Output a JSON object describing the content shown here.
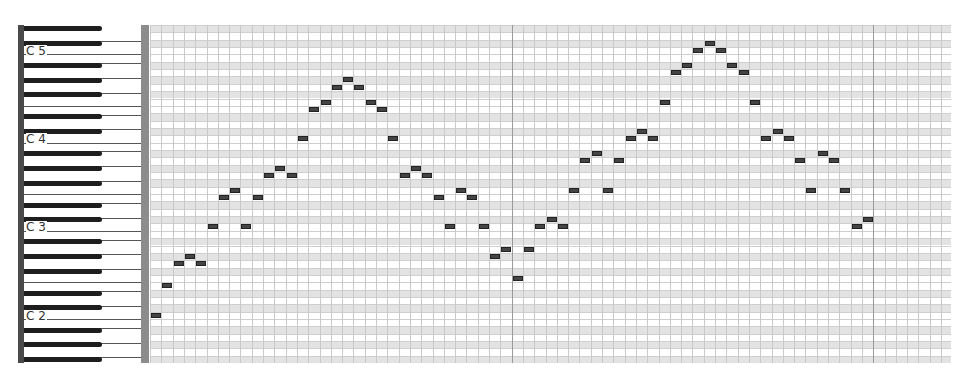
{
  "window": {
    "title": "Piano Roll"
  },
  "keyboard": {
    "octave_labels": [
      {
        "label": "C 5",
        "row": 3
      },
      {
        "label": "C 4",
        "row": 15
      },
      {
        "label": "C 3",
        "row": 27
      },
      {
        "label": "C 2",
        "row": 39
      }
    ],
    "top_pitch": 75,
    "row_count": 46
  },
  "grid": {
    "columns": 71,
    "column_width": 11.3,
    "row_height": 7.35,
    "bar_every": 32,
    "colors": {
      "black_row": "#e3e3e3",
      "line": "#cfcfcf",
      "bar_line": "#9a9a9a",
      "note": "#444444"
    }
  },
  "notes": [
    {
      "col": 0,
      "row": 39
    },
    {
      "col": 1,
      "row": 35
    },
    {
      "col": 2,
      "row": 32
    },
    {
      "col": 3,
      "row": 31
    },
    {
      "col": 4,
      "row": 32
    },
    {
      "col": 5,
      "row": 27
    },
    {
      "col": 6,
      "row": 23
    },
    {
      "col": 7,
      "row": 22
    },
    {
      "col": 8,
      "row": 27
    },
    {
      "col": 9,
      "row": 23
    },
    {
      "col": 10,
      "row": 20
    },
    {
      "col": 11,
      "row": 19
    },
    {
      "col": 12,
      "row": 20
    },
    {
      "col": 13,
      "row": 15
    },
    {
      "col": 14,
      "row": 11
    },
    {
      "col": 15,
      "row": 10
    },
    {
      "col": 16,
      "row": 8
    },
    {
      "col": 17,
      "row": 7
    },
    {
      "col": 18,
      "row": 8
    },
    {
      "col": 19,
      "row": 10
    },
    {
      "col": 20,
      "row": 11
    },
    {
      "col": 21,
      "row": 15
    },
    {
      "col": 22,
      "row": 20
    },
    {
      "col": 23,
      "row": 19
    },
    {
      "col": 24,
      "row": 20
    },
    {
      "col": 25,
      "row": 23
    },
    {
      "col": 26,
      "row": 27
    },
    {
      "col": 27,
      "row": 22
    },
    {
      "col": 28,
      "row": 23
    },
    {
      "col": 29,
      "row": 27
    },
    {
      "col": 30,
      "row": 31
    },
    {
      "col": 31,
      "row": 30
    },
    {
      "col": 32,
      "row": 34
    },
    {
      "col": 33,
      "row": 30
    },
    {
      "col": 34,
      "row": 27
    },
    {
      "col": 35,
      "row": 26
    },
    {
      "col": 36,
      "row": 27
    },
    {
      "col": 37,
      "row": 22
    },
    {
      "col": 38,
      "row": 18
    },
    {
      "col": 39,
      "row": 17
    },
    {
      "col": 40,
      "row": 22
    },
    {
      "col": 41,
      "row": 18
    },
    {
      "col": 42,
      "row": 15
    },
    {
      "col": 43,
      "row": 14
    },
    {
      "col": 44,
      "row": 15
    },
    {
      "col": 45,
      "row": 10
    },
    {
      "col": 46,
      "row": 6
    },
    {
      "col": 47,
      "row": 5
    },
    {
      "col": 48,
      "row": 3
    },
    {
      "col": 49,
      "row": 2
    },
    {
      "col": 50,
      "row": 3
    },
    {
      "col": 51,
      "row": 5
    },
    {
      "col": 52,
      "row": 6
    },
    {
      "col": 53,
      "row": 10
    },
    {
      "col": 54,
      "row": 15
    },
    {
      "col": 55,
      "row": 14
    },
    {
      "col": 56,
      "row": 15
    },
    {
      "col": 57,
      "row": 18
    },
    {
      "col": 58,
      "row": 22
    },
    {
      "col": 59,
      "row": 17
    },
    {
      "col": 60,
      "row": 18
    },
    {
      "col": 61,
      "row": 22
    },
    {
      "col": 62,
      "row": 27
    },
    {
      "col": 63,
      "row": 26
    }
  ]
}
